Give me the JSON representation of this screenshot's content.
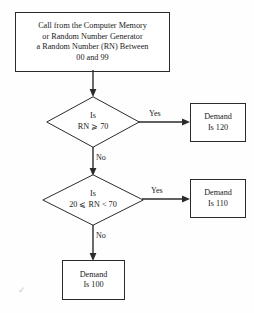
{
  "diagram": {
    "type": "flowchart",
    "start": {
      "label_lines": [
        "Call from the Computer Memory",
        "or Random Number Generator",
        "a Random Number (RN) Between",
        "00 and 99"
      ]
    },
    "decisions": [
      {
        "id": "decision-rn-70",
        "label_lines": [
          "Is",
          "RN ⩾ 70"
        ],
        "yes_label": "Yes",
        "no_label": "No"
      },
      {
        "id": "decision-rn-20-70",
        "label_lines": [
          "Is",
          "20 ⩽ RN < 70"
        ],
        "yes_label": "Yes",
        "no_label": "No"
      }
    ],
    "outcomes": [
      {
        "id": "demand-120",
        "label_lines": [
          "Demand",
          "Is 120"
        ]
      },
      {
        "id": "demand-110",
        "label_lines": [
          "Demand",
          "Is 110"
        ]
      },
      {
        "id": "demand-100",
        "label_lines": [
          "Demand",
          "Is 100"
        ]
      }
    ],
    "artifact_mark": "✓",
    "colors": {
      "stroke": "#2b2b2b",
      "background": "#fefefe",
      "text": "#1a1a1a"
    }
  }
}
